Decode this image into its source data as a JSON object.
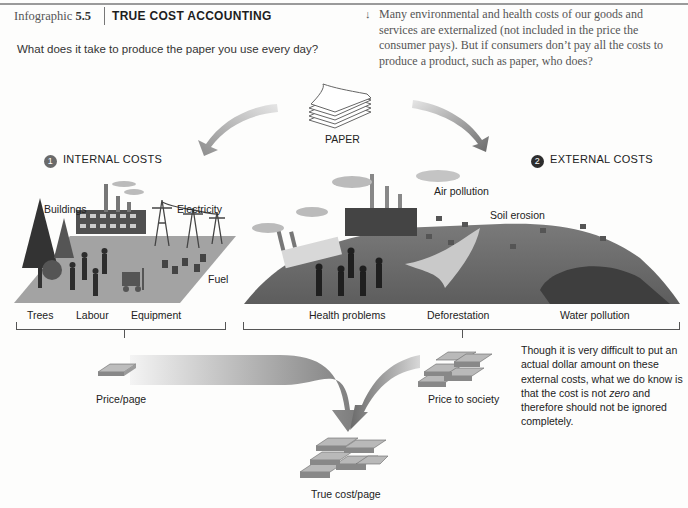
{
  "header": {
    "figure_label": "Infographic",
    "figure_number": "5.5",
    "title": "TRUE COST ACCOUNTING",
    "question": "What does it take to produce the paper you use every day?",
    "intro_arrow_icon": "↓",
    "intro": "Many environmental and health costs of our goods and services are externalized (not included in the price the consumer pays). But if consumers don’t pay all the costs to produce a product, such as paper, who does?"
  },
  "center": {
    "product_label": "PAPER"
  },
  "internal": {
    "number": "1",
    "heading": "INTERNAL COSTS",
    "labels": {
      "buildings": "Buildings",
      "electricity": "Electricity",
      "fuel": "Fuel",
      "trees": "Trees",
      "labour": "Labour",
      "equipment": "Equipment"
    }
  },
  "external": {
    "number": "2",
    "heading": "EXTERNAL COSTS",
    "labels": {
      "air_pollution": "Air pollution",
      "soil_erosion": "Soil erosion",
      "health_problems": "Health problems",
      "deforestation": "Deforestation",
      "water_pollution": "Water pollution"
    }
  },
  "outcome": {
    "price_page": "Price/page",
    "price_society": "Price to society",
    "true_cost": "True cost/page",
    "note_before": "Though it is very difficult to put an actual dollar amount on these external costs, what we do know is that the cost is not ",
    "note_emphasis": "zero",
    "note_after": " and therefore should not be ignored completely."
  },
  "colors": {
    "ground_internal": "#9a9a9a",
    "ground_external": "#6e6e6e",
    "arrow": "#8a8a8a",
    "text": "#222222"
  }
}
